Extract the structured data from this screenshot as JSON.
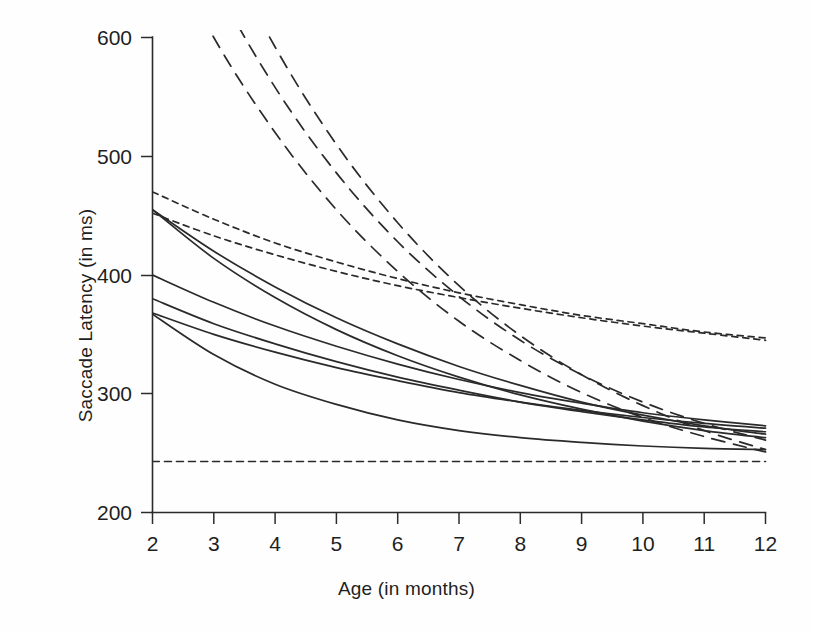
{
  "chart_data": {
    "type": "line",
    "title": "",
    "xlabel": "Age (in months)",
    "ylabel": "Saccade Latency (in ms)",
    "xlim": [
      2,
      12
    ],
    "ylim": [
      200,
      600
    ],
    "grid": false,
    "legend": null,
    "x_ticks": [
      "2",
      "3",
      "4",
      "5",
      "6",
      "7",
      "8",
      "9",
      "10",
      "11",
      "12"
    ],
    "y_ticks": [
      "200",
      "300",
      "400",
      "500",
      "600"
    ],
    "x": [
      2,
      3,
      4,
      5,
      6,
      7,
      8,
      9,
      10,
      11,
      12
    ],
    "line_color": "#2a2a2a",
    "series": [
      {
        "name": "long-dash-1",
        "style": "long-dashed",
        "values": [
          760,
          648,
          558,
          486,
          428,
          382,
          345,
          316,
          293,
          275,
          261
        ],
        "note": "starts above top of axis (off-scale at 2 months)"
      },
      {
        "name": "long-dash-2",
        "style": "long-dashed",
        "values": [
          700,
          600,
          520,
          455,
          403,
          361,
          328,
          301,
          280,
          264,
          251
        ],
        "note": "starts above top of axis (off-scale at 2 months)"
      },
      {
        "name": "long-dash-3",
        "style": "long-dashed",
        "values": [
          820,
          694,
          592,
          510,
          444,
          391,
          349,
          316,
          290,
          269,
          253
        ],
        "note": "starts above top of axis (off-scale at 2 months)"
      },
      {
        "name": "short-dash-1",
        "style": "short-dashed",
        "values": [
          470,
          447,
          427,
          411,
          397,
          385,
          375,
          366,
          359,
          352,
          347
        ]
      },
      {
        "name": "short-dash-2",
        "style": "short-dashed",
        "values": [
          452,
          433,
          417,
          403,
          391,
          381,
          372,
          364,
          357,
          351,
          345
        ]
      },
      {
        "name": "solid-1",
        "style": "solid",
        "values": [
          455,
          420,
          390,
          364,
          342,
          323,
          307,
          293,
          282,
          273,
          266
        ]
      },
      {
        "name": "solid-2",
        "style": "solid",
        "values": [
          455,
          414,
          381,
          354,
          332,
          314,
          299,
          287,
          277,
          269,
          263
        ]
      },
      {
        "name": "solid-3",
        "style": "solid",
        "values": [
          400,
          377,
          357,
          340,
          325,
          312,
          301,
          292,
          284,
          278,
          273
        ]
      },
      {
        "name": "solid-4",
        "style": "solid",
        "values": [
          380,
          359,
          342,
          327,
          314,
          303,
          293,
          285,
          278,
          272,
          268
        ]
      },
      {
        "name": "solid-5",
        "style": "solid",
        "values": [
          368,
          350,
          335,
          322,
          311,
          301,
          293,
          286,
          280,
          275,
          271
        ]
      },
      {
        "name": "solid-6",
        "style": "solid",
        "values": [
          367,
          333,
          308,
          291,
          278,
          269,
          263,
          259,
          256,
          254,
          253
        ]
      },
      {
        "name": "asymptote",
        "style": "short-dashed-horizontal",
        "values": [
          243,
          243,
          243,
          243,
          243,
          243,
          243,
          243,
          243,
          243,
          243
        ]
      }
    ]
  },
  "axes": {
    "x_title": "Age (in months)",
    "y_title": "Saccade Latency (in ms)",
    "x_tick_labels": [
      "2",
      "3",
      "4",
      "5",
      "6",
      "7",
      "8",
      "9",
      "10",
      "11",
      "12"
    ],
    "y_tick_labels": [
      "200",
      "300",
      "400",
      "500",
      "600"
    ]
  }
}
